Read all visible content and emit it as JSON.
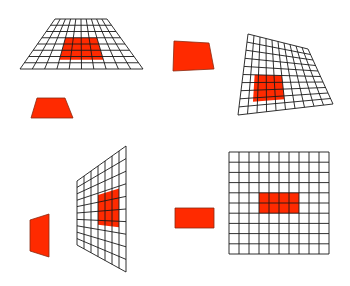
{
  "figure": {
    "colors": {
      "background": "#ffffff",
      "grid_stroke": "#1a1a1a",
      "red_fill": "#ff2a00",
      "red_stroke": "#8a2a10"
    }
  },
  "grids": [
    {
      "name": "floor-perspective-grid",
      "cols": 10,
      "rows": 8,
      "corners": {
        "tl": [
          55,
          19
        ],
        "tr": [
          107,
          19
        ],
        "br": [
          143,
          69
        ],
        "bl": [
          20,
          69
        ]
      },
      "highlight": {
        "c0": 3,
        "c1": 7,
        "r0": 3,
        "r1": 6.5
      }
    },
    {
      "name": "tilted-grid",
      "cols": 10,
      "rows": 10,
      "corners": {
        "tl": [
          248,
          34
        ],
        "tr": [
          308,
          49
        ],
        "br": [
          333,
          104
        ],
        "bl": [
          238,
          115
        ]
      },
      "highlight": {
        "c0": 1.5,
        "c1": 5,
        "r0": 5,
        "r1": 8.5
      }
    },
    {
      "name": "wall-perspective-grid",
      "cols": 7,
      "rows": 10,
      "corners": {
        "tl": [
          77,
          181
        ],
        "tr": [
          126,
          146
        ],
        "br": [
          126,
          272
        ],
        "bl": [
          77,
          245
        ]
      },
      "highlight": {
        "c0": 3,
        "c1": 6,
        "r0": 3.2,
        "r1": 6.5
      }
    },
    {
      "name": "frontal-grid",
      "cols": 10,
      "rows": 10,
      "corners": {
        "tl": [
          229,
          152
        ],
        "tr": [
          329,
          152
        ],
        "br": [
          329,
          254
        ],
        "bl": [
          229,
          254
        ]
      },
      "highlight": {
        "c0": 3,
        "c1": 7,
        "r0": 4,
        "r1": 6
      }
    }
  ],
  "shapes": [
    {
      "name": "red-trapezoid-floor",
      "points": [
        [
          37,
          98
        ],
        [
          65,
          98
        ],
        [
          73,
          118
        ],
        [
          31,
          118
        ]
      ]
    },
    {
      "name": "red-quad-tilted",
      "points": [
        [
          174,
          41
        ],
        [
          209,
          43
        ],
        [
          214,
          69
        ],
        [
          173,
          71
        ]
      ]
    },
    {
      "name": "red-quad-wall",
      "points": [
        [
          30,
          220
        ],
        [
          49,
          214
        ],
        [
          49,
          257
        ],
        [
          30,
          251
        ]
      ]
    },
    {
      "name": "red-rectangle-frontal",
      "points": [
        [
          175,
          208
        ],
        [
          214,
          208
        ],
        [
          214,
          228
        ],
        [
          175,
          228
        ]
      ]
    }
  ]
}
